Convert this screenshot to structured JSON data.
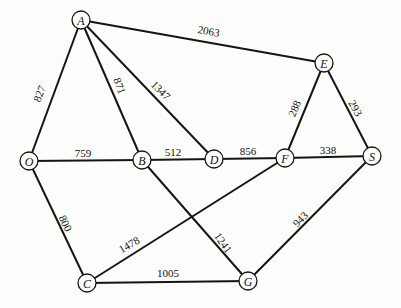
{
  "diagram": {
    "type": "weighted-undirected-graph",
    "nodes": [
      {
        "id": "A",
        "label": "A",
        "x": 81,
        "y": 20
      },
      {
        "id": "E",
        "label": "E",
        "x": 324,
        "y": 63
      },
      {
        "id": "O",
        "label": "O",
        "x": 29,
        "y": 161
      },
      {
        "id": "B",
        "label": "B",
        "x": 142,
        "y": 160
      },
      {
        "id": "D",
        "label": "D",
        "x": 214,
        "y": 159
      },
      {
        "id": "F",
        "label": "F",
        "x": 285,
        "y": 158
      },
      {
        "id": "S",
        "label": "S",
        "x": 372,
        "y": 156
      },
      {
        "id": "C",
        "label": "C",
        "x": 87,
        "y": 283
      },
      {
        "id": "G",
        "label": "G",
        "x": 248,
        "y": 281
      }
    ],
    "edges": [
      {
        "from": "A",
        "to": "E",
        "weight": "2063",
        "lx": 208,
        "ly": 35,
        "rot": 10
      },
      {
        "from": "A",
        "to": "O",
        "weight": "827",
        "lx": 43,
        "ly": 95,
        "rot": -69
      },
      {
        "from": "A",
        "to": "B",
        "weight": "871",
        "lx": 116,
        "ly": 87,
        "rot": 71
      },
      {
        "from": "A",
        "to": "D",
        "weight": "1347",
        "lx": 158,
        "ly": 93,
        "rot": 45
      },
      {
        "from": "O",
        "to": "B",
        "weight": "759",
        "lx": 83,
        "ly": 157,
        "rot": 0
      },
      {
        "from": "B",
        "to": "D",
        "weight": "512",
        "lx": 173,
        "ly": 156,
        "rot": 0
      },
      {
        "from": "D",
        "to": "F",
        "weight": "856",
        "lx": 248,
        "ly": 155,
        "rot": 0
      },
      {
        "from": "F",
        "to": "S",
        "weight": "338",
        "lx": 328,
        "ly": 154,
        "rot": 0
      },
      {
        "from": "E",
        "to": "F",
        "weight": "288",
        "lx": 298,
        "ly": 110,
        "rot": -66
      },
      {
        "from": "E",
        "to": "S",
        "weight": "293",
        "lx": 352,
        "ly": 110,
        "rot": 60
      },
      {
        "from": "O",
        "to": "C",
        "weight": "800",
        "lx": 62,
        "ly": 225,
        "rot": 64
      },
      {
        "from": "B",
        "to": "G",
        "weight": "1241",
        "lx": 220,
        "ly": 245,
        "rot": 55
      },
      {
        "from": "F",
        "to": "C",
        "weight": "1478",
        "lx": 131,
        "ly": 248,
        "rot": -30
      },
      {
        "from": "C",
        "to": "G",
        "weight": "1005",
        "lx": 168,
        "ly": 277,
        "rot": 0
      },
      {
        "from": "S",
        "to": "G",
        "weight": "943",
        "lx": 303,
        "ly": 222,
        "rot": -45
      }
    ]
  }
}
